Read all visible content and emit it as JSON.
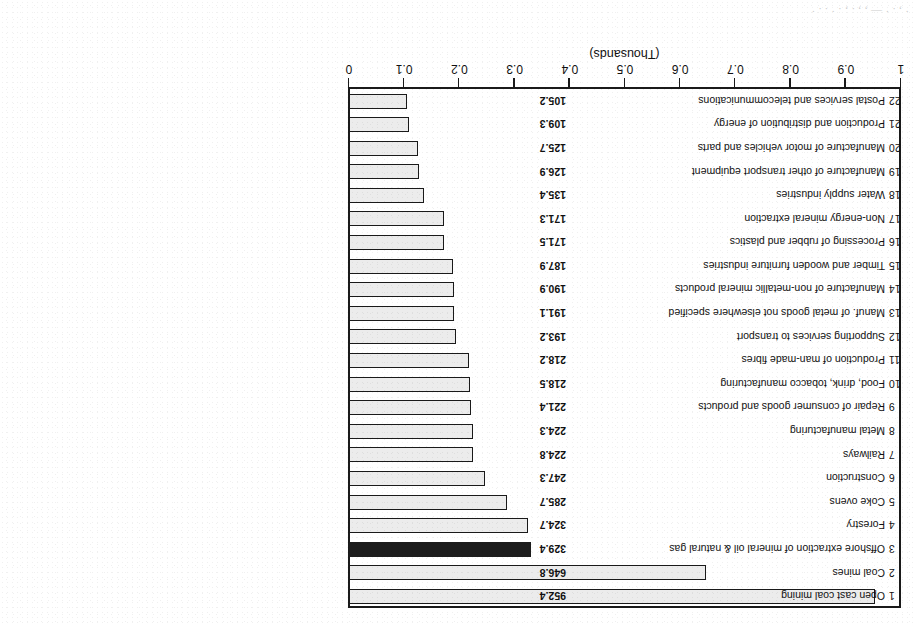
{
  "figure": {
    "rotation_note": "180",
    "cut_text_top": "· , . · — , , . ‚ . · . . ·"
  },
  "chart_data": {
    "type": "bar",
    "orientation": "horizontal",
    "title": "",
    "xlabel": "(Thousands)",
    "ylabel": "",
    "xlim": [
      0,
      1
    ],
    "xticks": [
      "0",
      "0.1",
      "0.2",
      "0.3",
      "0.4",
      "0.5",
      "0.6",
      "0.7",
      "0.8",
      "0.9",
      "1"
    ],
    "grid": false,
    "legend": "none",
    "value_unit": "thousands",
    "bar_fill_color": "#ececec",
    "bar_edge_color": "#1a1a1a",
    "highlight_color": "#1c1c1c",
    "highlight_index": 2,
    "categories": [
      "Open cast coal mining",
      "Coal mines",
      "Offshore extraction of mineral oil & natural gas",
      "Forestry",
      "Coke ovens",
      "Construction",
      "Railways",
      "Metal manufacturing",
      "Repair of consumer goods and products",
      "Food, drink, tobacco manufacturing",
      "Production of man-made fibres",
      "Supporting services to transport",
      "Manuf. of metal goods not elsewhere specified",
      "Manufacture of non-metallic mineral products",
      "Timber and wooden furniture industries",
      "Processing of rubber and plastics",
      "Non-energy mineral extraction",
      "Water supply industries",
      "Manufacture of other transport equipment",
      "Manufacture of motor vehicles and parts",
      "Production and distribution of energy",
      "Postal services and telecommunications"
    ],
    "values": [
      952.4,
      646.8,
      329.4,
      324.7,
      285.7,
      247.3,
      224.8,
      224.3,
      221.4,
      218.5,
      218.2,
      193.2,
      191.1,
      190.9,
      187.9,
      171.5,
      171.3,
      135.4,
      126.9,
      125.7,
      109.3,
      105.2
    ],
    "value_labels": [
      "952.4",
      "646.8",
      "329.4",
      "324.7",
      "285.7",
      "247.3",
      "224.8",
      "224.3",
      "221.4",
      "218.5",
      "218.2",
      "193.2",
      "191.1",
      "190.9",
      "187.9",
      "171.5",
      "171.3",
      "135.4",
      "126.9",
      "125.7",
      "109.3",
      "105.2"
    ],
    "rank_labels": [
      "1",
      "2",
      "3",
      "4",
      "5",
      "6",
      "7",
      "8",
      "9",
      "10",
      "11",
      "12",
      "13",
      "14",
      "15",
      "16",
      "17",
      "18",
      "19",
      "20",
      "21",
      "22"
    ]
  }
}
